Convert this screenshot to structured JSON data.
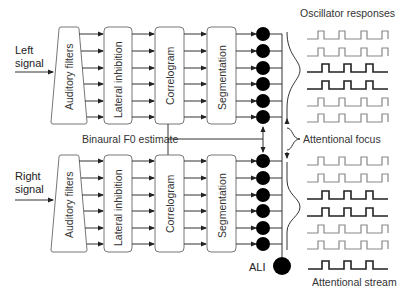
{
  "diagram": {
    "inputs": {
      "left": {
        "line1": "Left",
        "line2": "signal"
      },
      "right": {
        "line1": "Right",
        "line2": "signal"
      }
    },
    "blocks": {
      "auditory_filters": "Auditory filters",
      "lateral_inhibition": "Lateral inhibition",
      "correlogram": "Correlogram",
      "segmentation": "Segmentation"
    },
    "binaural_label": "Binaural F0 estimate",
    "attentional_focus_label": "Attentional focus",
    "oscillator_title": "Oscillator responses",
    "ali_label": "ALI",
    "attentional_stream_label": "Attentional stream",
    "channels_per_group": 6,
    "oscillator_rows_top": [
      "grey",
      "grey",
      "dark",
      "dark",
      "grey",
      "grey"
    ],
    "oscillator_rows_bottom": [
      "grey",
      "grey",
      "dark",
      "dark",
      "grey",
      "grey"
    ],
    "colors": {
      "line": "#333333",
      "box_border": "#777777",
      "oscillator_dark": "#222222",
      "oscillator_grey": "#888888",
      "node_fill": "#000000"
    }
  }
}
